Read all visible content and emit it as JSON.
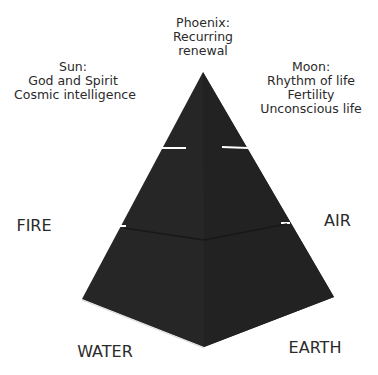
{
  "diagram": {
    "type": "tiered-pyramid",
    "colors": {
      "pyramid": "#262626",
      "pyramid_shade": "#1f1f1f",
      "separator": "#ffffff",
      "text": "#2a2a2a",
      "background": "#ffffff"
    },
    "tiers": [
      "top",
      "middle",
      "base"
    ]
  },
  "labels": {
    "sun": {
      "title": "Sun:",
      "lines": [
        "God and Spirit",
        "Cosmic intelligence"
      ]
    },
    "phoenix": {
      "lines": [
        "Phoenix:",
        "Recurring",
        "renewal"
      ]
    },
    "moon": {
      "title": "Moon:",
      "lines": [
        "Rhythm of life",
        "Fertility",
        "Unconscious life"
      ]
    },
    "elements": {
      "fire": "FIRE",
      "air": "AIR",
      "water": "WATER",
      "earth": "EARTH"
    }
  }
}
